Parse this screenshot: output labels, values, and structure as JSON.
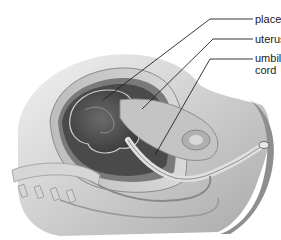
{
  "diagram": {
    "labels": [
      {
        "id": "placenta",
        "text": "placenta"
      },
      {
        "id": "uterus",
        "text": "uterus"
      },
      {
        "id": "umbilical-cord",
        "line1": "umbilical",
        "line2": "cord"
      }
    ]
  }
}
